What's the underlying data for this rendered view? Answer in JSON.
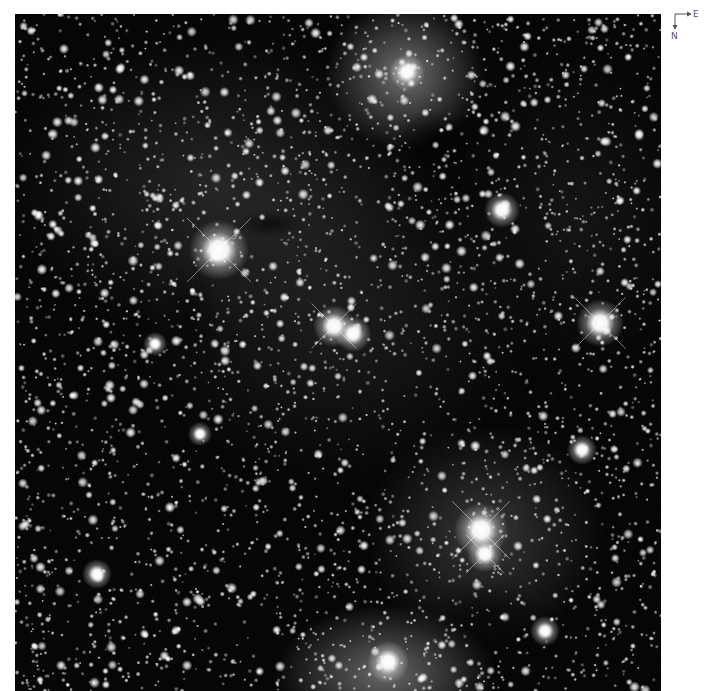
{
  "image": {
    "subject": "star field with dark and bright nebulae",
    "width": 646,
    "height": 677,
    "background_color": "#050505",
    "seed": 7331,
    "faint_star_count": 3200,
    "medium_star_count": 520,
    "nebulae": [
      {
        "name": "top-reflection-nebula",
        "x": 390,
        "y": 60,
        "rx": 80,
        "ry": 75,
        "alpha": 0.55
      },
      {
        "name": "upper-left-glow",
        "x": 200,
        "y": 170,
        "rx": 210,
        "ry": 150,
        "alpha": 0.16
      },
      {
        "name": "central-glow",
        "x": 320,
        "y": 300,
        "rx": 200,
        "ry": 170,
        "alpha": 0.12
      },
      {
        "name": "lower-right-cluster-glow",
        "x": 470,
        "y": 520,
        "rx": 120,
        "ry": 110,
        "alpha": 0.25
      },
      {
        "name": "bottom-emission-nebula",
        "x": 370,
        "y": 660,
        "rx": 110,
        "ry": 70,
        "alpha": 0.5
      },
      {
        "name": "right-haze",
        "x": 560,
        "y": 200,
        "rx": 120,
        "ry": 160,
        "alpha": 0.08
      }
    ],
    "dark_lanes": [
      {
        "name": "top-dark-cloud",
        "x": 420,
        "y": 125,
        "rx": 40,
        "ry": 30,
        "alpha": 0.7
      },
      {
        "name": "snake-dark-lane",
        "x": 255,
        "y": 210,
        "rx": 35,
        "ry": 14,
        "alpha": 0.6
      },
      {
        "name": "left-dark-lane",
        "x": 175,
        "y": 300,
        "rx": 30,
        "ry": 50,
        "alpha": 0.5
      },
      {
        "name": "bottom-dark-cloud",
        "x": 470,
        "y": 600,
        "rx": 60,
        "ry": 35,
        "alpha": 0.6
      }
    ],
    "bright_stars": [
      {
        "x": 204,
        "y": 236,
        "r": 10,
        "spikes": true
      },
      {
        "x": 319,
        "y": 312,
        "r": 7,
        "spikes": true
      },
      {
        "x": 338,
        "y": 320,
        "r": 6,
        "spikes": false
      },
      {
        "x": 585,
        "y": 309,
        "r": 8,
        "spikes": true
      },
      {
        "x": 487,
        "y": 196,
        "r": 6,
        "spikes": false
      },
      {
        "x": 466,
        "y": 516,
        "r": 9,
        "spikes": true
      },
      {
        "x": 470,
        "y": 540,
        "r": 6,
        "spikes": true
      },
      {
        "x": 392,
        "y": 58,
        "r": 6,
        "spikes": false
      },
      {
        "x": 373,
        "y": 648,
        "r": 7,
        "spikes": false
      },
      {
        "x": 567,
        "y": 436,
        "r": 5,
        "spikes": false
      },
      {
        "x": 530,
        "y": 617,
        "r": 5,
        "spikes": false
      },
      {
        "x": 82,
        "y": 560,
        "r": 5,
        "spikes": false
      },
      {
        "x": 140,
        "y": 330,
        "r": 4,
        "spikes": false
      },
      {
        "x": 185,
        "y": 420,
        "r": 4,
        "spikes": false
      }
    ]
  },
  "compass": {
    "east_label": "E",
    "north_label": "N"
  }
}
